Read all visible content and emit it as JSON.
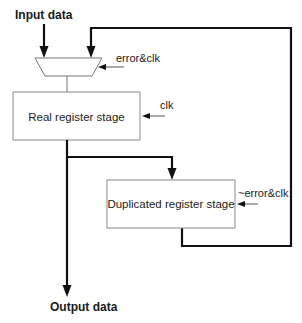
{
  "diagram": {
    "input_label": "Input data",
    "output_label": "Output data",
    "mux": {
      "control_label": "error&clk"
    },
    "real_register": {
      "label": "Real register stage",
      "control_label": "clk"
    },
    "duplicated_register": {
      "label": "Duplicated register stage",
      "control_label": "~error&clk"
    },
    "colors": {
      "background": "#ffffff",
      "thick_line": "#111111",
      "thin_line": "#888888",
      "text": "#222222"
    }
  }
}
